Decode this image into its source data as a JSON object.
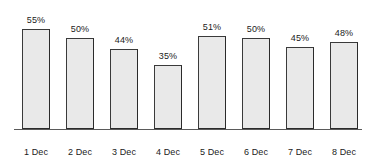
{
  "chart_data": {
    "type": "bar",
    "title": "",
    "subtitle": "",
    "xlabel": "",
    "ylabel": "",
    "categories": [
      "1 Dec",
      "2 Dec",
      "3 Dec",
      "4 Dec",
      "5 Dec",
      "6 Dec",
      "7 Dec",
      "8 Dec"
    ],
    "values": [
      55,
      50,
      44,
      35,
      51,
      50,
      45,
      48
    ],
    "value_labels": [
      "55%",
      "50%",
      "44%",
      "35%",
      "51%",
      "50%",
      "45%",
      "48%"
    ],
    "unit": "%",
    "ylim": [
      0,
      62
    ],
    "grid": false,
    "legend": false,
    "legend_position": "none",
    "bar_fill_color": "#e9e9e9",
    "bar_border_color": "#2b2b2b",
    "axis_color": "#5a5a5a",
    "background_color": "#ffffff",
    "text_color": "#1b1b1b"
  }
}
